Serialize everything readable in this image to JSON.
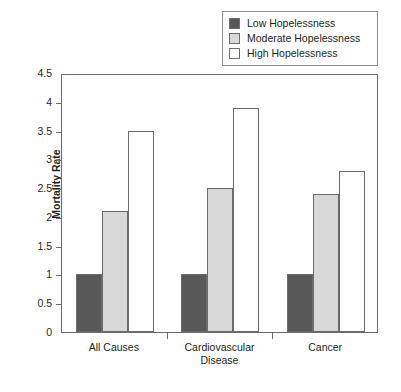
{
  "chart_data": {
    "type": "bar",
    "title": "",
    "xlabel": "",
    "ylabel": "Mortality Rate",
    "ylim": [
      0,
      4.5
    ],
    "yticks": [
      "0",
      "0.5",
      "1",
      "1.5",
      "2",
      "2.5",
      "3",
      "3.5",
      "4",
      "4.5"
    ],
    "ytick_values": [
      0,
      0.5,
      1,
      1.5,
      2,
      2.5,
      3,
      3.5,
      4,
      4.5
    ],
    "grid": false,
    "legend_position": "top-right",
    "categories": [
      "All Causes",
      "Cardiovascular Disease",
      "Cancer"
    ],
    "category_lines": [
      [
        "All Causes"
      ],
      [
        "Cardiovascular",
        "Disease"
      ],
      [
        "Cancer"
      ]
    ],
    "series": [
      {
        "name": "Low Hopelessness",
        "color": "#585858",
        "values": [
          1.0,
          1.0,
          1.0
        ]
      },
      {
        "name": "Moderate Hopelessness",
        "color": "#d8d8d8",
        "values": [
          2.1,
          2.5,
          2.4
        ]
      },
      {
        "name": "High Hopelessness",
        "color": "#ffffff",
        "values": [
          3.5,
          3.9,
          2.8
        ]
      }
    ]
  },
  "legend": {
    "items": [
      {
        "label": "Low Hopelessness",
        "color": "#585858"
      },
      {
        "label": "Moderate Hopelessness",
        "color": "#d8d8d8"
      },
      {
        "label": "High Hopelessness",
        "color": "#ffffff"
      }
    ]
  }
}
